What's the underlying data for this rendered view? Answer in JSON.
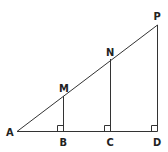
{
  "diagram": {
    "type": "geometry-similar-triangles",
    "points": {
      "A": {
        "label": "A",
        "x": 17,
        "y": 131.5
      },
      "B": {
        "label": "B",
        "x": 63.5,
        "y": 131.5
      },
      "C": {
        "label": "C",
        "x": 110.5,
        "y": 131.5
      },
      "D": {
        "label": "D",
        "x": 157.5,
        "y": 131.5
      },
      "M": {
        "label": "M",
        "x": 63.5,
        "y": 96
      },
      "N": {
        "label": "N",
        "x": 110.5,
        "y": 59
      },
      "P": {
        "label": "P",
        "x": 157.5,
        "y": 25
      }
    },
    "segments": [
      [
        "A",
        "D"
      ],
      [
        "A",
        "P"
      ],
      [
        "M",
        "B"
      ],
      [
        "N",
        "C"
      ],
      [
        "P",
        "D"
      ]
    ],
    "right_angles": [
      "B",
      "C",
      "D"
    ],
    "line_color": "#333333",
    "label_color": "#222222"
  }
}
